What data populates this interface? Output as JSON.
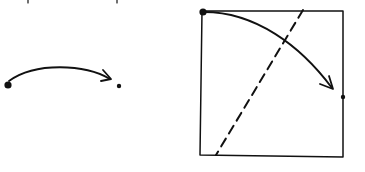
{
  "diagram": {
    "colors": {
      "ink": "#111111",
      "background": "#ffffff"
    },
    "top_text_fragments": [
      {
        "x": 28,
        "glyph": "p"
      },
      {
        "x": 117,
        "glyph": "p"
      }
    ],
    "left_figure": {
      "start_point": {
        "x": 8,
        "y": 85,
        "size": "large"
      },
      "end_point": {
        "x": 119,
        "y": 86,
        "size": "small"
      },
      "arrow": {
        "from": [
          10,
          80
        ],
        "ctrl": [
          60,
          55
        ],
        "to": [
          111,
          79
        ]
      }
    },
    "right_figure": {
      "square": {
        "tl": [
          202,
          11
        ],
        "tr": [
          343,
          11
        ],
        "br": [
          343,
          157
        ],
        "bl": [
          200,
          155
        ]
      },
      "start_point": {
        "x": 203,
        "y": 12,
        "size": "large"
      },
      "end_point": {
        "x": 343,
        "y": 97,
        "size": "small"
      },
      "arrow": {
        "from": [
          204,
          12
        ],
        "ctrl": [
          285,
          12
        ],
        "to": [
          333,
          89
        ]
      },
      "dashed_line": {
        "from": [
          303,
          10
        ],
        "to": [
          216,
          155
        ]
      }
    }
  }
}
